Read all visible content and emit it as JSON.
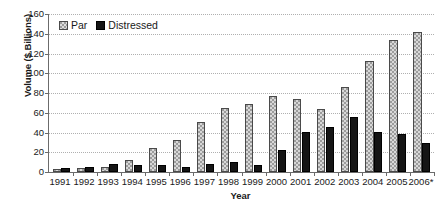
{
  "chart_data": {
    "type": "bar",
    "title": "",
    "subtitle": "",
    "xlabel": "Year",
    "ylabel": "Volume ($ Billions)",
    "categories": [
      "1991",
      "1992",
      "1993",
      "1994",
      "1995",
      "1996",
      "1997",
      "1998",
      "1999",
      "2000",
      "2001",
      "2002",
      "2003",
      "2004",
      "2005",
      "2006*"
    ],
    "series": [
      {
        "name": "Par",
        "values": [
          3,
          4.5,
          5.5,
          12.5,
          24.5,
          32.5,
          51,
          64.5,
          68.5,
          76.5,
          74,
          63.5,
          86,
          112,
          133.5,
          141.5
        ]
      },
      {
        "name": "Distressed",
        "values": [
          4,
          5.5,
          8,
          7,
          7.5,
          5.5,
          8,
          10.5,
          7.5,
          22.5,
          40.5,
          46,
          55.5,
          40.5,
          39,
          29
        ]
      }
    ],
    "ylim": [
      0,
      160
    ],
    "yticks": [
      0,
      20,
      40,
      60,
      80,
      100,
      120,
      140,
      160
    ],
    "ytick_labels": [
      "0",
      "20",
      "40",
      "60",
      "80",
      "100",
      "120",
      "140",
      "160"
    ],
    "grid": true,
    "grid_axis": "y",
    "legend_position": "top-left",
    "colors": {
      "par": "#9c9c9c",
      "par_pattern": "#d8d8d8",
      "distressed": "#151515",
      "axis": "#6b6b6b",
      "gridline": "#b0b0b0",
      "background": "#ffffff",
      "text": "#1a1a1a"
    }
  },
  "legend": {
    "items": [
      {
        "label": "Par",
        "swatch": "checkered-gray-swatch"
      },
      {
        "label": "Distressed",
        "swatch": "solid-black-swatch"
      }
    ]
  },
  "axes": {
    "y_title": "Volume ($ Billions)",
    "x_title": "Year"
  }
}
